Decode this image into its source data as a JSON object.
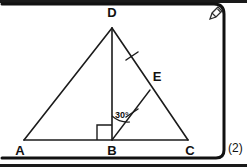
{
  "page": {
    "question_number": "(2)"
  },
  "diagram": {
    "vertices": [
      {
        "name": "D",
        "label": "D",
        "x": 112,
        "y": 28
      },
      {
        "name": "A",
        "label": "A",
        "x": 24,
        "y": 140
      },
      {
        "name": "B",
        "label": "B",
        "x": 112,
        "y": 140
      },
      {
        "name": "C",
        "label": "C",
        "x": 188,
        "y": 140
      },
      {
        "name": "E",
        "label": "E",
        "x": 150,
        "y": 90
      }
    ],
    "vertex_labels": {
      "D": "D",
      "A": "A",
      "B": "B",
      "C": "C",
      "E": "E"
    },
    "angle_label": "30°",
    "right_angle_at": "B",
    "segments": [
      {
        "name": "AD",
        "from": "A",
        "to": "D"
      },
      {
        "name": "AC",
        "from": "A",
        "to": "C"
      },
      {
        "name": "DC",
        "from": "D",
        "to": "C"
      },
      {
        "name": "DB",
        "from": "D",
        "to": "B"
      },
      {
        "name": "BE",
        "from": "B",
        "to": "E"
      }
    ],
    "tick_marks": [
      {
        "name": "tick-on-DE",
        "segment": "DE",
        "count": 1
      },
      {
        "name": "tick-on-BE",
        "segment": "BE",
        "count": 1
      }
    ]
  },
  "toolbar": {
    "edit_icon": "pencil-icon"
  }
}
